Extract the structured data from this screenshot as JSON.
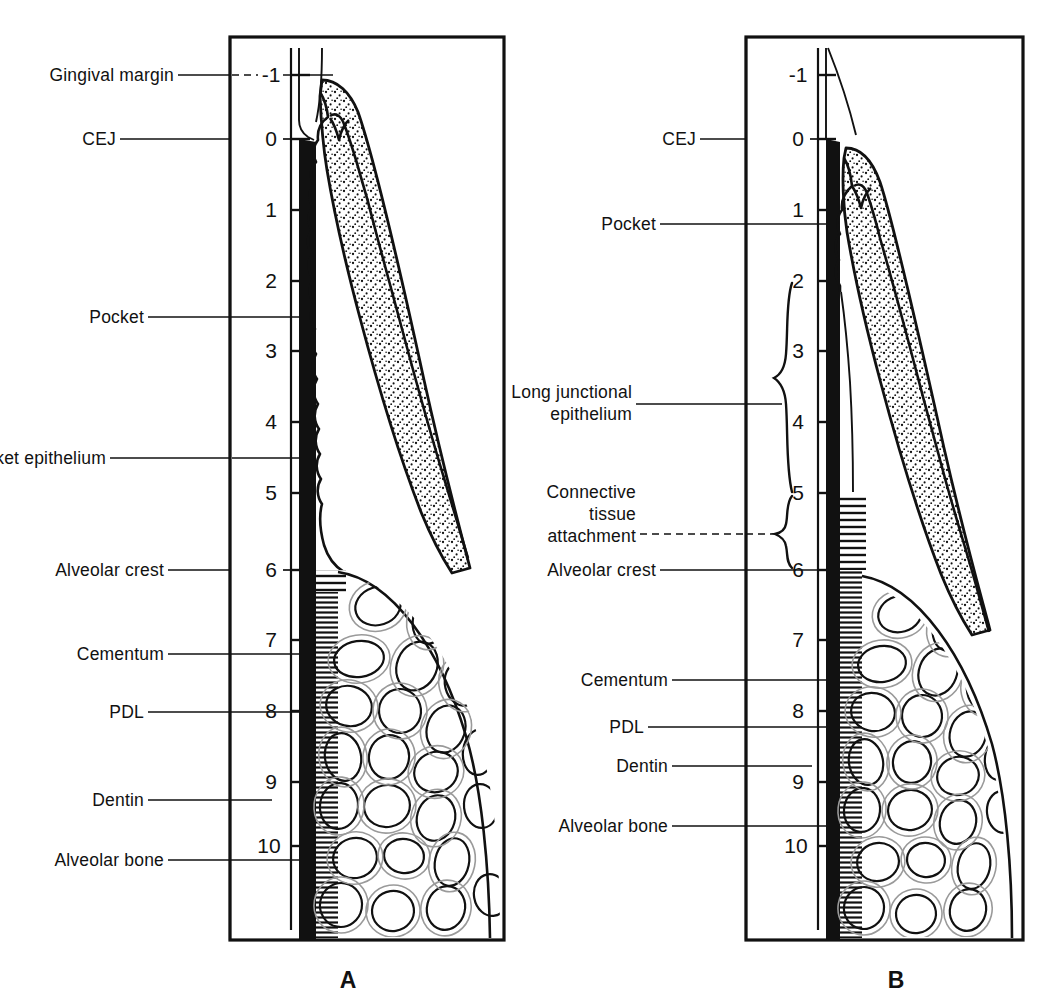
{
  "figure": {
    "ink_color": "#111111",
    "background_color": "#ffffff"
  },
  "scale": {
    "unit": "mm",
    "ticks": [
      "-1",
      "0",
      "1",
      "2",
      "3",
      "4",
      "5",
      "6",
      "7",
      "8",
      "9",
      "10"
    ],
    "values": [
      -1,
      0,
      1,
      2,
      3,
      4,
      5,
      6,
      7,
      8,
      9,
      10
    ],
    "top_value": -1,
    "bottom_value": 10
  },
  "panels": [
    {
      "id": "A",
      "letter": "A",
      "caption": "A",
      "labels": [
        {
          "key": "gingival-margin",
          "text": "Gingival margin",
          "tick": -1
        },
        {
          "key": "cej",
          "text": "CEJ",
          "tick": 0
        },
        {
          "key": "pocket",
          "text": "Pocket",
          "tick": 2.5
        },
        {
          "key": "pocket-epithelium",
          "text": "Pocket epithelium",
          "tick": 4.3
        },
        {
          "key": "alveolar-crest",
          "text": "Alveolar crest",
          "tick": 6
        },
        {
          "key": "cementum",
          "text": "Cementum",
          "tick": 7.3
        },
        {
          "key": "pdl",
          "text": "PDL",
          "tick": 8.3
        },
        {
          "key": "dentin",
          "text": "Dentin",
          "tick": 9.4
        },
        {
          "key": "alveolar-bone",
          "text": "Alveolar bone",
          "tick": 10.4
        }
      ],
      "scale_ticks": [
        "-1",
        "0",
        "1",
        "2",
        "3",
        "4",
        "5",
        "6",
        "7",
        "8",
        "9",
        "10"
      ]
    },
    {
      "id": "B",
      "letter": "B",
      "caption": "B",
      "labels": [
        {
          "key": "cej",
          "text": "CEJ",
          "tick": 0
        },
        {
          "key": "pocket",
          "text": "Pocket",
          "tick": 1.2
        },
        {
          "key": "long-junctional-epithelium",
          "text": "Long junctional\nepithelium",
          "line1": "Long junctional",
          "line2": "epithelium",
          "tick": 3.5
        },
        {
          "key": "connective-tissue-attachment",
          "text": "Connective\ntissue\nattachment",
          "line1": "Connective",
          "line2": "tissue",
          "line3": "attachment",
          "tick": 5.5
        },
        {
          "key": "alveolar-crest",
          "text": "Alveolar crest",
          "tick": 6
        },
        {
          "key": "cementum",
          "text": "Cementum",
          "tick": 7.3
        },
        {
          "key": "pdl",
          "text": "PDL",
          "tick": 8.3
        },
        {
          "key": "dentin",
          "text": "Dentin",
          "tick": 9.0
        },
        {
          "key": "alveolar-bone",
          "text": "Alveolar bone",
          "tick": 9.9
        }
      ],
      "braces": [
        {
          "key": "long-junctional-epithelium-brace",
          "from_tick": 2,
          "to_tick": 5
        },
        {
          "key": "connective-tissue-attachment-brace",
          "from_tick": 5,
          "to_tick": 6
        }
      ],
      "scale_ticks": [
        "-1",
        "0",
        "1",
        "2",
        "3",
        "4",
        "5",
        "6",
        "7",
        "8",
        "9",
        "10"
      ]
    }
  ]
}
